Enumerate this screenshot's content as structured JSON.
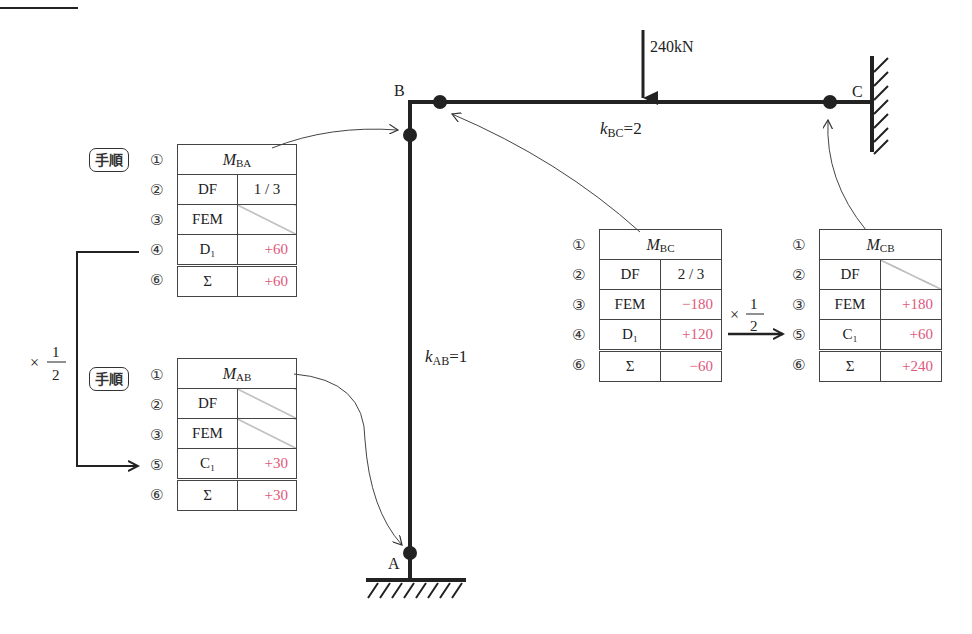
{
  "structure": {
    "nodes": {
      "A": "A",
      "B": "B",
      "C": "C"
    },
    "load": "240kN",
    "stiffness_bc": {
      "k": "k",
      "sub": "BC",
      "val": "=2"
    },
    "stiffness_ab": {
      "k": "k",
      "sub": "AB",
      "val": "=1"
    }
  },
  "carry_over": {
    "times": "×",
    "num": "1",
    "den": "2"
  },
  "step_badge": "手順",
  "tables": {
    "MBA": {
      "title_m": "M",
      "title_sub": "BA",
      "step_nums": [
        "①",
        "②",
        "③",
        "④",
        "⑥"
      ],
      "rows": [
        {
          "label": "DF",
          "value": "1 / 3",
          "type": "center"
        },
        {
          "label": "FEM",
          "value": "",
          "type": "slash"
        },
        {
          "label": "D₁",
          "value": "+60",
          "type": "red"
        },
        {
          "label": "Σ",
          "value": "+60",
          "type": "red",
          "sum": true
        }
      ]
    },
    "MAB": {
      "title_m": "M",
      "title_sub": "AB",
      "step_nums": [
        "①",
        "②",
        "③",
        "⑤",
        "⑥"
      ],
      "rows": [
        {
          "label": "DF",
          "value": "",
          "type": "slash"
        },
        {
          "label": "FEM",
          "value": "",
          "type": "slash"
        },
        {
          "label": "C₁",
          "value": "+30",
          "type": "red"
        },
        {
          "label": "Σ",
          "value": "+30",
          "type": "red",
          "sum": true
        }
      ]
    },
    "MBC": {
      "title_m": "M",
      "title_sub": "BC",
      "step_nums": [
        "①",
        "②",
        "③",
        "④",
        "⑥"
      ],
      "rows": [
        {
          "label": "DF",
          "value": "2 / 3",
          "type": "center"
        },
        {
          "label": "FEM",
          "value": "−180",
          "type": "red"
        },
        {
          "label": "D₁",
          "value": "+120",
          "type": "red"
        },
        {
          "label": "Σ",
          "value": "−60",
          "type": "red",
          "sum": true
        }
      ]
    },
    "MCB": {
      "title_m": "M",
      "title_sub": "CB",
      "step_nums": [
        "①",
        "②",
        "③",
        "⑤",
        "⑥"
      ],
      "rows": [
        {
          "label": "DF",
          "value": "",
          "type": "slash"
        },
        {
          "label": "FEM",
          "value": "+180",
          "type": "red"
        },
        {
          "label": "C₁",
          "value": "+60",
          "type": "red"
        },
        {
          "label": "Σ",
          "value": "+240",
          "type": "red",
          "sum": true
        }
      ]
    }
  }
}
